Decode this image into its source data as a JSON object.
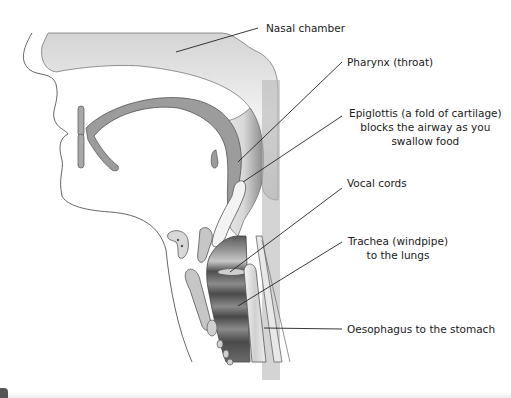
{
  "diagram": {
    "colors": {
      "background": "#ffffff",
      "outline": "#555555",
      "tissue_light": "#e6e6e6",
      "tissue_mid": "#b5b5b5",
      "tissue_dark": "#6e6e6e",
      "cartilage": "#c9c9c9",
      "label_text": "#1a1a1a",
      "leader_line": "#222222"
    },
    "labels": [
      {
        "id": "nasal-chamber",
        "lines": [
          "Nasal chamber"
        ]
      },
      {
        "id": "pharynx",
        "lines": [
          "Pharynx (throat)"
        ]
      },
      {
        "id": "epiglottis",
        "lines": [
          "Epiglottis (a fold of cartilage)",
          "blocks the airway as you",
          "swallow food"
        ]
      },
      {
        "id": "vocal-cords",
        "lines": [
          "Vocal cords"
        ]
      },
      {
        "id": "trachea",
        "lines": [
          "Trachea (windpipe)",
          "to the lungs"
        ]
      },
      {
        "id": "oesophagus",
        "lines": [
          "Oesophagus to the stomach"
        ]
      }
    ]
  }
}
